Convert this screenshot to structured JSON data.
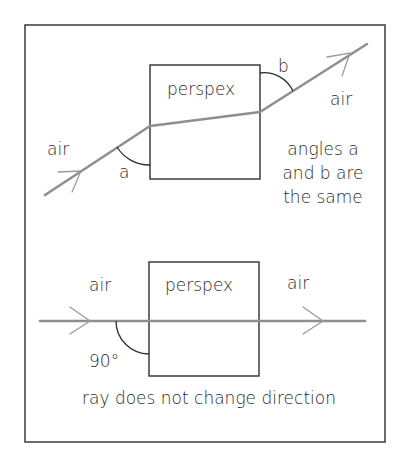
{
  "figure": {
    "top_panel": {
      "medium_label": "perspex",
      "left_medium_label": "air",
      "right_medium_label": "air",
      "angle_a_label": "a",
      "angle_b_label": "b",
      "caption_lines": [
        "angles a",
        "and b are",
        "the same"
      ]
    },
    "bottom_panel": {
      "medium_label": "perspex",
      "left_medium_label": "air",
      "right_medium_label": "air",
      "angle_label": "90°",
      "caption": "ray does not change direction"
    },
    "colors": {
      "frame": "#3a3a3a",
      "ray": "#8f8f8f",
      "text": "#2a2a2a"
    }
  }
}
